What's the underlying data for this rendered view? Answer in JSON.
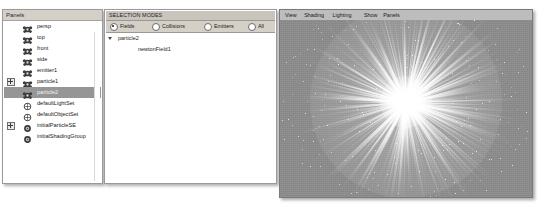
{
  "outliner": {
    "title": "Panels",
    "items": [
      {
        "label": "persp",
        "icon": "camera-icon",
        "expander": false,
        "selected": false
      },
      {
        "label": "top",
        "icon": "camera-icon",
        "expander": false,
        "selected": false
      },
      {
        "label": "front",
        "icon": "camera-icon",
        "expander": false,
        "selected": false
      },
      {
        "label": "side",
        "icon": "camera-icon",
        "expander": false,
        "selected": false
      },
      {
        "label": "emitter1",
        "icon": "emitter-icon",
        "expander": false,
        "selected": false
      },
      {
        "label": "particle1",
        "icon": "particle-icon",
        "expander": true,
        "selected": false
      },
      {
        "label": "particle2",
        "icon": "particle-icon",
        "expander": false,
        "selected": true
      },
      {
        "label": "defaultLightSet",
        "icon": "light-set-icon",
        "expander": false,
        "selected": false
      },
      {
        "label": "defaultObjectSet",
        "icon": "object-set-icon",
        "expander": false,
        "selected": false
      },
      {
        "label": "initialParticleSE",
        "icon": "shading-group-icon",
        "expander": true,
        "selected": false
      },
      {
        "label": "initialShadingGroup",
        "icon": "shading-group-icon",
        "expander": false,
        "selected": false
      }
    ]
  },
  "selection_modes": {
    "header": "SELECTION MODES",
    "options": [
      {
        "label": "Fields",
        "selected": true
      },
      {
        "label": "Collisions",
        "selected": false
      },
      {
        "label": "Emitters",
        "selected": false
      },
      {
        "label": "All",
        "selected": false
      }
    ],
    "tree": [
      {
        "label": "particle2",
        "depth": 0,
        "expanded": true
      },
      {
        "label": "newtonField1",
        "depth": 1,
        "expanded": false
      }
    ]
  },
  "viewport": {
    "menus": [
      "View",
      "Shading",
      "Lighting",
      "Show",
      "Panels"
    ],
    "background_color": "#8d8d8d",
    "particle_color": "#ffffff",
    "scene": "particle-burst"
  }
}
